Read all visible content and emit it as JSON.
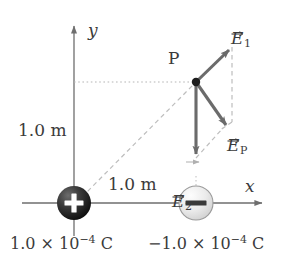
{
  "figure": {
    "name": "electric-field-superposition-diagram",
    "axes": {
      "x_label": "x",
      "y_label": "y"
    },
    "point": {
      "label": "P",
      "x_m": 1.0,
      "y_m": 1.0
    },
    "distances": [
      {
        "name": "vertical-distance",
        "label": "1.0 m"
      },
      {
        "name": "horizontal-distance",
        "label": "1.0 m"
      }
    ],
    "charges": [
      {
        "name": "positive-charge",
        "sign": "+",
        "value_label": "1.0 × 10",
        "exponent": "−4",
        "unit": "C",
        "color": "#2b2b2b"
      },
      {
        "name": "negative-charge",
        "sign": "−",
        "value_label": "−1.0 × 10",
        "exponent": "−4",
        "unit": "C",
        "color": "#d8d8d8"
      }
    ],
    "vectors": [
      {
        "name": "field-vector-1",
        "symbol": "E",
        "subscript": "1",
        "direction": "up-right"
      },
      {
        "name": "resultant-field-vector",
        "symbol": "E",
        "subscript": "P",
        "direction": "down-right"
      },
      {
        "name": "field-vector-2",
        "symbol": "E",
        "subscript": "2",
        "direction": "down"
      }
    ],
    "colors": {
      "axis": "#6e6e6e",
      "vector": "#6b6b6b",
      "dashed": "#b6b6b6",
      "dotted": "#b6b6b6",
      "text": "#3b3b3b"
    }
  }
}
